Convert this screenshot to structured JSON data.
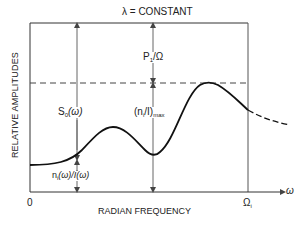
{
  "diagram": {
    "title": "λ = CONSTANT",
    "ylabel": "RELATIVE AMPLITUDES",
    "xlabel": "RADIAN FREQUENCY",
    "x_axis_symbol": "ω",
    "origin_label": "0",
    "x_marker_label": "Ω",
    "x_marker_sub": "i",
    "annotations": {
      "s0": "S",
      "s0_sub": "0",
      "s0_arg": "(ω)",
      "p1_base": "P",
      "p1_sub": "1",
      "p1_rest": "/Ω",
      "nmax_open": "(n",
      "nmax_sub": "i",
      "nmax_mid": "/I)",
      "nmax_sub2": "max",
      "ni_base": "n",
      "ni_sub": "i",
      "ni_rest": "(ω)/I(ω)"
    },
    "colors": {
      "line": "#222222",
      "arrow": "#555555",
      "background": "#ffffff"
    }
  }
}
